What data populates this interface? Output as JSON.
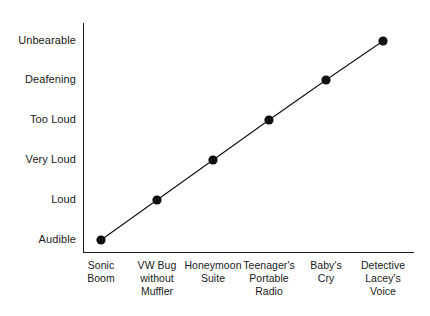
{
  "chart_data": {
    "type": "line",
    "title": "",
    "subtitle": "",
    "xlabel": "",
    "ylabel": "",
    "grid": false,
    "legend": "none",
    "categories": [
      "Sonic Boom",
      "VW Bug without Muffler",
      "Honeymoon Suite",
      "Teenager's Portable Radio",
      "Baby's Cry",
      "Detective Lacey's Voice"
    ],
    "category_lines": [
      [
        "Sonic",
        "Boom"
      ],
      [
        "VW Bug",
        "without",
        "Muffler"
      ],
      [
        "Honeymoon",
        "Suite"
      ],
      [
        "Teenager's",
        "Portable",
        "Radio"
      ],
      [
        "Baby's",
        "Cry"
      ],
      [
        "Detective",
        "Lacey's",
        "Voice"
      ]
    ],
    "y_tick_labels": [
      "Audible",
      "Loud",
      "Very Loud",
      "Too Loud",
      "Deafening",
      "Unbearable"
    ],
    "ylim": [
      0,
      5
    ],
    "values": [
      0,
      1,
      2,
      3,
      4,
      5
    ],
    "value_labels": [
      "Audible",
      "Loud",
      "Very Loud",
      "Too Loud",
      "Deafening",
      "Unbearable"
    ],
    "series": [
      {
        "name": "Loudness",
        "values": [
          0,
          1,
          2,
          3,
          4,
          5
        ]
      }
    ],
    "marker_style": "filled-circle",
    "colors": {
      "line": "#111111",
      "marker": "#111111",
      "axis": "#1a1a1a",
      "background": "#ffffff",
      "text": "#1a1a1a"
    }
  },
  "geometry": {
    "marker_x": [
      101,
      157,
      213,
      269,
      326,
      383
    ],
    "marker_y": [
      240,
      200,
      160,
      120,
      80,
      41
    ],
    "y_label_y": [
      240,
      200,
      160,
      120,
      80,
      41
    ],
    "x_label_x": [
      62,
      118,
      174,
      230,
      287,
      344
    ]
  }
}
